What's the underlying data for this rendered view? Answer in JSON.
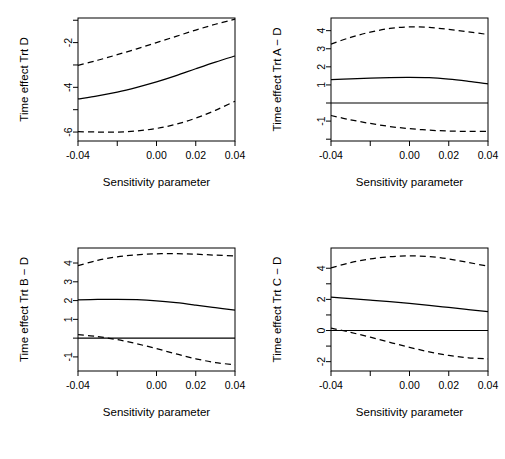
{
  "figure": {
    "layout": "2x2 grid of line plots",
    "background_color": "#ffffff",
    "foreground_color": "#000000"
  },
  "panels": [
    {
      "id": "panel-trt-d",
      "ylabel": "Time effect Trt D",
      "xlabel": "Sensitivity parameter",
      "position": "top-left"
    },
    {
      "id": "panel-trt-a-minus-d",
      "ylabel": "Time effect Trt A − D",
      "xlabel": "Sensitivity parameter",
      "position": "top-right"
    },
    {
      "id": "panel-trt-b-minus-d",
      "ylabel": "Time effect Trt B − D",
      "xlabel": "Sensitivity parameter",
      "position": "bottom-left"
    },
    {
      "id": "panel-trt-c-minus-d",
      "ylabel": "Time effect Trt C − D",
      "xlabel": "Sensitivity parameter",
      "position": "bottom-right"
    }
  ],
  "chart_data": [
    {
      "type": "line",
      "title": "",
      "xlabel": "Sensitivity parameter",
      "ylabel": "Time effect Trt D",
      "xlim": [
        -0.04,
        0.04
      ],
      "ylim": [
        -6.4,
        -0.9
      ],
      "xticks": [
        -0.04,
        -0.02,
        0.0,
        0.02,
        0.04
      ],
      "xticklabels": [
        "-0.04",
        "",
        "0.00",
        "0.02",
        "0.04"
      ],
      "yticks": [
        -1,
        -2,
        -3,
        -4,
        -5,
        -6,
        -7
      ],
      "yticklabels": [
        "",
        "-2",
        "",
        "-4",
        "",
        "-6",
        ""
      ],
      "grid": false,
      "legend": "none",
      "reference_line": null,
      "x": [
        -0.04,
        -0.03,
        -0.02,
        -0.01,
        0.0,
        0.01,
        0.02,
        0.03,
        0.04
      ],
      "series": [
        {
          "name": "upper confidence bound",
          "style": "dashed",
          "values": [
            -3.02,
            -2.79,
            -2.54,
            -2.28,
            -2.0,
            -1.72,
            -1.44,
            -1.18,
            -0.95
          ]
        },
        {
          "name": "point estimate",
          "style": "solid",
          "values": [
            -4.52,
            -4.38,
            -4.21,
            -4.0,
            -3.76,
            -3.48,
            -3.17,
            -2.87,
            -2.6
          ]
        },
        {
          "name": "lower confidence bound",
          "style": "dashed",
          "values": [
            -5.98,
            -6.0,
            -6.0,
            -5.95,
            -5.84,
            -5.65,
            -5.38,
            -5.03,
            -4.62
          ]
        }
      ]
    },
    {
      "type": "line",
      "title": "",
      "xlabel": "Sensitivity parameter",
      "ylabel": "Time effect Trt A − D",
      "xlim": [
        -0.04,
        0.04
      ],
      "ylim": [
        -2.1,
        4.7
      ],
      "xticks": [
        -0.04,
        -0.02,
        0.0,
        0.02,
        0.04
      ],
      "xticklabels": [
        "-0.04",
        "",
        "0.00",
        "0.02",
        "0.04"
      ],
      "yticks": [
        -2,
        -1,
        0,
        1,
        2,
        3,
        4
      ],
      "yticklabels": [
        "",
        "-1",
        "",
        "1",
        "2",
        "3",
        "4"
      ],
      "grid": false,
      "legend": "none",
      "reference_line": 0,
      "x": [
        -0.04,
        -0.03,
        -0.02,
        -0.01,
        0.0,
        0.01,
        0.02,
        0.03,
        0.04
      ],
      "series": [
        {
          "name": "upper confidence bound",
          "style": "dashed",
          "values": [
            3.26,
            3.63,
            3.92,
            4.12,
            4.21,
            4.18,
            4.07,
            3.93,
            3.79
          ]
        },
        {
          "name": "point estimate",
          "style": "solid",
          "values": [
            1.29,
            1.34,
            1.38,
            1.41,
            1.42,
            1.4,
            1.32,
            1.2,
            1.06
          ]
        },
        {
          "name": "lower confidence bound",
          "style": "dashed",
          "values": [
            -0.69,
            -0.93,
            -1.13,
            -1.3,
            -1.42,
            -1.5,
            -1.55,
            -1.57,
            -1.56
          ]
        }
      ]
    },
    {
      "type": "line",
      "title": "",
      "xlabel": "Sensitivity parameter",
      "ylabel": "Time effect Trt B − D",
      "xlim": [
        -0.04,
        0.04
      ],
      "ylim": [
        -1.75,
        4.8
      ],
      "xticks": [
        -0.04,
        -0.02,
        0.0,
        0.02,
        0.04
      ],
      "xticklabels": [
        "-0.04",
        "",
        "0.00",
        "0.02",
        "0.04"
      ],
      "yticks": [
        -1,
        0,
        1,
        2,
        3,
        4
      ],
      "yticklabels": [
        "-1",
        "",
        "1",
        "2",
        "3",
        "4"
      ],
      "grid": false,
      "legend": "none",
      "reference_line": 0,
      "x": [
        -0.04,
        -0.03,
        -0.02,
        -0.01,
        0.0,
        0.01,
        0.02,
        0.03,
        0.04
      ],
      "series": [
        {
          "name": "upper confidence bound",
          "style": "dashed",
          "values": [
            3.86,
            4.14,
            4.33,
            4.44,
            4.49,
            4.5,
            4.47,
            4.42,
            4.38
          ]
        },
        {
          "name": "point estimate",
          "style": "solid",
          "values": [
            2.04,
            2.06,
            2.07,
            2.05,
            1.99,
            1.89,
            1.76,
            1.62,
            1.49
          ]
        },
        {
          "name": "lower confidence bound",
          "style": "dashed",
          "values": [
            0.19,
            0.08,
            -0.08,
            -0.3,
            -0.56,
            -0.84,
            -1.1,
            -1.3,
            -1.42
          ]
        }
      ]
    },
    {
      "type": "line",
      "title": "",
      "xlabel": "Sensitivity parameter",
      "ylabel": "Time effect Trt C − D",
      "xlim": [
        -0.04,
        0.04
      ],
      "ylim": [
        -2.6,
        5.3
      ],
      "xticks": [
        -0.04,
        -0.02,
        0.0,
        0.02,
        0.04
      ],
      "xticklabels": [
        "-0.04",
        "",
        "0.00",
        "0.02",
        "0.04"
      ],
      "yticks": [
        -2,
        -1,
        0,
        1,
        2,
        3,
        4
      ],
      "yticklabels": [
        "-2",
        "",
        "0",
        "",
        "2",
        "",
        "4"
      ],
      "grid": false,
      "legend": "none",
      "reference_line": 0,
      "x": [
        -0.04,
        -0.03,
        -0.02,
        -0.01,
        0.0,
        0.01,
        0.02,
        0.03,
        0.04
      ],
      "series": [
        {
          "name": "upper confidence bound",
          "style": "dashed",
          "values": [
            4.02,
            4.36,
            4.6,
            4.74,
            4.79,
            4.75,
            4.6,
            4.37,
            4.13
          ]
        },
        {
          "name": "point estimate",
          "style": "solid",
          "values": [
            2.14,
            2.05,
            1.95,
            1.85,
            1.74,
            1.62,
            1.48,
            1.34,
            1.22
          ]
        },
        {
          "name": "lower confidence bound",
          "style": "dashed",
          "values": [
            0.16,
            -0.12,
            -0.43,
            -0.76,
            -1.08,
            -1.37,
            -1.6,
            -1.75,
            -1.82
          ]
        }
      ]
    }
  ]
}
